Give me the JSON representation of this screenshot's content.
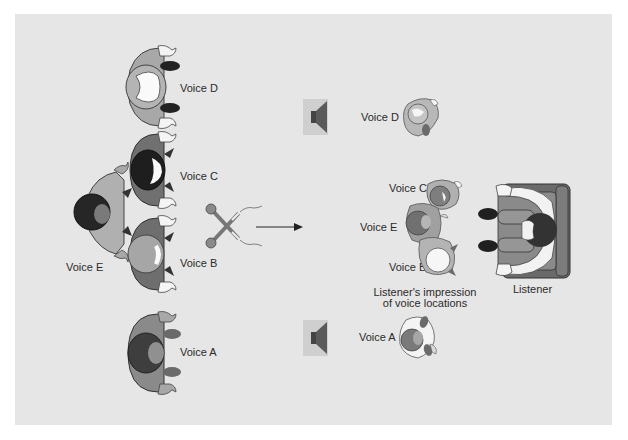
{
  "figure": {
    "type": "stereo-recording-diagram",
    "colors": {
      "panel_background": "#e6e6e6",
      "page_background": "#ffffff",
      "figure_light": "#a8a8a8",
      "figure_mid": "#888888",
      "figure_dark": "#505050",
      "figure_black": "#202020",
      "hand_white": "#f4f4f4",
      "speaker_box": "#cfcfcf",
      "speaker_cone": "#555555",
      "text": "#2a2a2a"
    },
    "singers": [
      {
        "id": "D",
        "label": "Voice D"
      },
      {
        "id": "C",
        "label": "Voice C"
      },
      {
        "id": "E",
        "label": "Voice E"
      },
      {
        "id": "B",
        "label": "Voice B"
      },
      {
        "id": "A",
        "label": "Voice A"
      }
    ],
    "microphones": {
      "count": 2,
      "icon": "crossed-microphones-icon"
    },
    "arrow": {
      "direction": "right",
      "icon": "arrow-right-icon"
    },
    "speakers": [
      {
        "position": "top",
        "icon": "loudspeaker-icon"
      },
      {
        "position": "bottom",
        "icon": "loudspeaker-icon"
      }
    ],
    "phantom_voices": [
      {
        "id": "D",
        "label": "Voice D"
      },
      {
        "id": "C",
        "label": "Voice C"
      },
      {
        "id": "E",
        "label": "Voice E"
      },
      {
        "id": "B",
        "label": "Voice B"
      },
      {
        "id": "A",
        "label": "Voice A"
      }
    ],
    "impression_caption_line1": "Listener's impression",
    "impression_caption_line2": "of voice locations",
    "listener_label": "Listener"
  }
}
